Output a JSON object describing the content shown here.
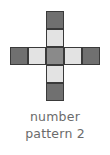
{
  "figure": {
    "caption_line1": "number",
    "caption_line2": "pattern 2",
    "caption_color": "#6b6b6b",
    "background": "#ffffff"
  },
  "palette": {
    "dark": "#707070",
    "medium": "#8a8a8a",
    "light": "#e3e3e3",
    "border": "#3a3a3a",
    "empty": "transparent"
  },
  "chart_data": {
    "type": "heatmap",
    "title": "number pattern 2",
    "shape": "plus-cross",
    "rows": 5,
    "cols": 5,
    "cell_size_px": 18,
    "xlabel": "",
    "ylabel": "",
    "grid": [
      [
        "empty",
        "empty",
        "dark",
        "empty",
        "empty"
      ],
      [
        "empty",
        "empty",
        "light",
        "empty",
        "empty"
      ],
      [
        "dark",
        "light",
        "medium",
        "light",
        "dark"
      ],
      [
        "empty",
        "empty",
        "light",
        "empty",
        "empty"
      ],
      [
        "empty",
        "empty",
        "dark",
        "empty",
        "empty"
      ]
    ],
    "legend": [
      {
        "name": "dark",
        "color": "#707070"
      },
      {
        "name": "medium",
        "color": "#8a8a8a"
      },
      {
        "name": "light",
        "color": "#e3e3e3"
      }
    ]
  }
}
